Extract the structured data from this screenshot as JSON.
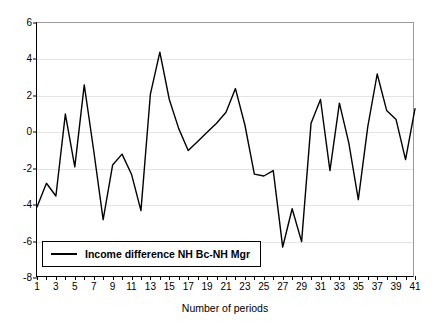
{
  "chart_data": {
    "type": "line",
    "title": "",
    "xlabel": "Number of periods",
    "ylabel": "",
    "xlim": [
      1,
      41
    ],
    "ylim": [
      -8,
      6
    ],
    "grid": true,
    "legend_position": "bottom-left",
    "y_ticks": [
      6,
      4,
      2,
      0,
      -2,
      -4,
      -6,
      -8
    ],
    "x_ticks": [
      1,
      3,
      5,
      7,
      9,
      11,
      13,
      15,
      17,
      19,
      21,
      23,
      25,
      27,
      29,
      31,
      33,
      35,
      37,
      39,
      41
    ],
    "x_tick_labels": [
      "1",
      "3",
      "5",
      "7",
      "9",
      "11",
      "13",
      "15",
      "17",
      "19",
      "21",
      "23",
      "25",
      "27",
      "29",
      "31",
      "33",
      "35",
      "37",
      "39",
      "41"
    ],
    "y_tick_labels": [
      "6",
      "4",
      "2",
      "0",
      "-2",
      "-4",
      "-6",
      "-8"
    ],
    "x": [
      1,
      2,
      3,
      4,
      5,
      6,
      7,
      8,
      9,
      10,
      11,
      12,
      13,
      14,
      15,
      16,
      17,
      18,
      19,
      20,
      21,
      22,
      23,
      24,
      25,
      26,
      27,
      28,
      29,
      30,
      31,
      32,
      33,
      34,
      35,
      36,
      37,
      38,
      39,
      40,
      41
    ],
    "series": [
      {
        "name": "Income difference NH Bc-NH Mgr",
        "color": "#000000",
        "values": [
          -4.1,
          -2.8,
          -3.5,
          1.0,
          -1.9,
          2.6,
          -1.0,
          -4.8,
          -1.8,
          -1.2,
          -2.3,
          -4.3,
          2.1,
          4.4,
          1.8,
          0.2,
          -1.0,
          -0.5,
          0.0,
          0.5,
          1.1,
          2.4,
          0.4,
          -2.3,
          -2.4,
          -2.1,
          -6.3,
          -4.2,
          -6.0,
          0.5,
          1.8,
          -2.1,
          1.6,
          -0.6,
          -3.7,
          0.3,
          3.2,
          1.2,
          0.7,
          -1.5,
          1.3
        ]
      }
    ]
  },
  "legend": {
    "entries": [
      {
        "label": "Income difference NH Bc-NH Mgr",
        "swatch": "line-swatch"
      }
    ]
  }
}
